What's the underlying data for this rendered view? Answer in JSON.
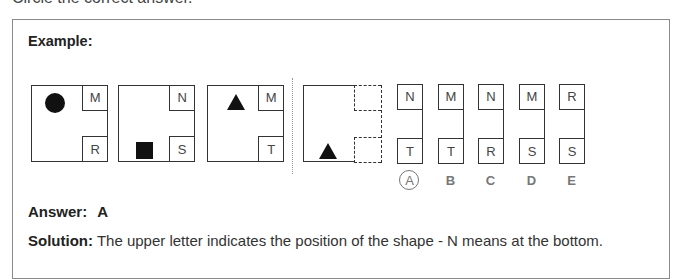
{
  "instruction": "Circle the correct answer.",
  "example": {
    "title": "Example:",
    "figures": [
      {
        "shape": "circle",
        "shape_position": "top",
        "top_letter": "M",
        "bottom_letter": "R"
      },
      {
        "shape": "square",
        "shape_position": "bottom",
        "top_letter": "N",
        "bottom_letter": "S"
      },
      {
        "shape": "triangle",
        "shape_position": "top",
        "top_letter": "M",
        "bottom_letter": "T"
      }
    ],
    "question_figure": {
      "shape": "triangle",
      "shape_position": "bottom",
      "top_letter": "",
      "bottom_letter": ""
    },
    "options": [
      {
        "label": "A",
        "top_letter": "N",
        "bottom_letter": "T",
        "circled": true
      },
      {
        "label": "B",
        "top_letter": "M",
        "bottom_letter": "T",
        "circled": false
      },
      {
        "label": "C",
        "top_letter": "N",
        "bottom_letter": "R",
        "circled": false
      },
      {
        "label": "D",
        "top_letter": "M",
        "bottom_letter": "S",
        "circled": false
      },
      {
        "label": "E",
        "top_letter": "R",
        "bottom_letter": "S",
        "circled": false
      }
    ],
    "answer_label": "Answer:",
    "answer_value": "A",
    "solution_label": "Solution:",
    "solution_text": " The upper letter indicates the position of the shape - N means at the bottom."
  }
}
